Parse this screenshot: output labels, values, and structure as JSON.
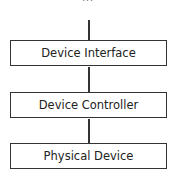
{
  "diagram": {
    "top_fragment": "...",
    "boxes": [
      {
        "label": "Device Interface"
      },
      {
        "label": "Device Controller"
      },
      {
        "label": "Physical Device"
      }
    ],
    "colors": {
      "stroke": "#333333",
      "background": "#ffffff"
    }
  }
}
